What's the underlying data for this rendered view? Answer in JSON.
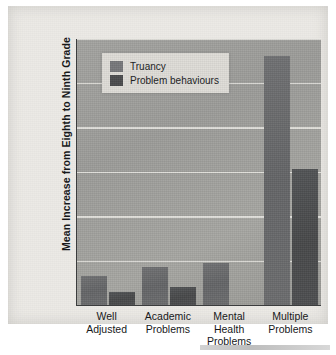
{
  "chart_data": {
    "type": "bar",
    "title": "",
    "xlabel": "",
    "ylabel": "Mean Increase from Eighth to Ninth Grade",
    "ylim": [
      0,
      1.2
    ],
    "grid": true,
    "legend_position": "top-left",
    "yticks": [
      "0",
      "0.2",
      "0.4",
      "0.6",
      "0.8",
      "1",
      "1.2"
    ],
    "ytick_values": [
      0,
      0.2,
      0.4,
      0.6,
      0.8,
      1,
      1.2
    ],
    "categories": [
      "Well Adjusted",
      "Academic Problems",
      "Mental Health Problems",
      "Multiple Problems"
    ],
    "category_lines": [
      [
        "Well",
        "Adjusted"
      ],
      [
        "Academic",
        "Problems"
      ],
      [
        "Mental Health",
        "Problems"
      ],
      [
        "Multiple",
        "Problems"
      ]
    ],
    "series": [
      {
        "name": "Truancy",
        "color": "#6b6c6e",
        "values": [
          0.13,
          0.17,
          0.19,
          1.12
        ]
      },
      {
        "name": "Problem behaviours",
        "color": "#4a4b4d",
        "values": [
          0.06,
          0.08,
          0,
          0.61
        ]
      }
    ]
  },
  "colors": {
    "plot_background": "#a0a09d",
    "page_background": "#eceae6",
    "gridline": "#e8e7e3",
    "axis": "#3b3c3d",
    "text": "#17181a",
    "legend_background": "#dedcd7"
  }
}
